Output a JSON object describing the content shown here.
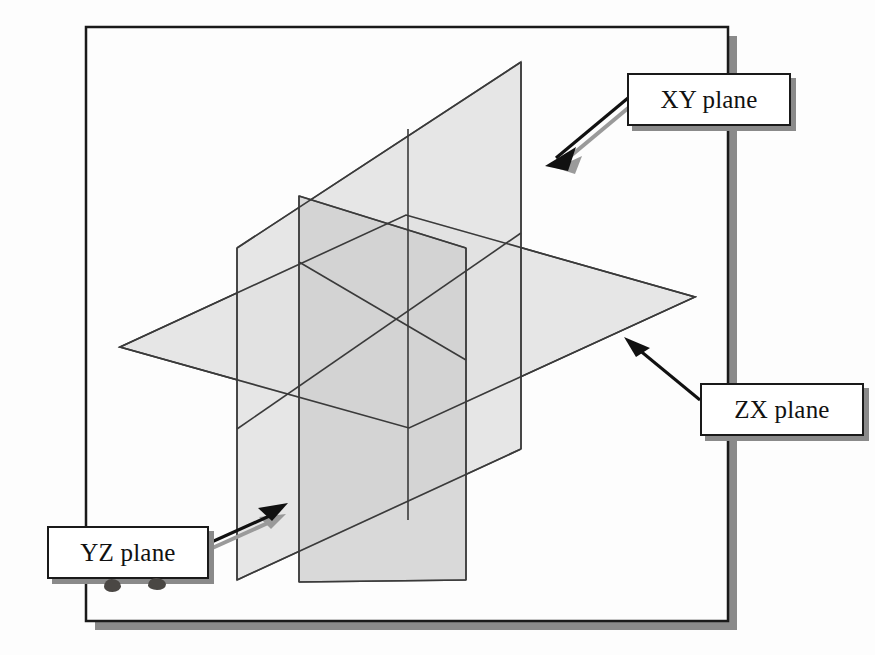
{
  "figure": {
    "type": "diagram",
    "background_color": "#fdfdfd",
    "frame": {
      "name": "figure-border",
      "border_color": "#1a1a1a",
      "shadow_color": "#8a8a8a",
      "x": 86,
      "y": 27,
      "width": 642,
      "height": 594
    }
  },
  "callouts": [
    {
      "id": "xy",
      "label": "XY plane",
      "border_color": "#1a1a1a",
      "shadow_color": "#8a8a8a",
      "fill_color": "#ffffff"
    },
    {
      "id": "zx",
      "label": "ZX plane",
      "border_color": "#1a1a1a",
      "shadow_color": "#8a8a8a",
      "fill_color": "#ffffff"
    },
    {
      "id": "yz",
      "label": "YZ plane",
      "border_color": "#1a1a1a",
      "shadow_color": "#8a8a8a",
      "fill_color": "#ffffff"
    }
  ],
  "planes": [
    {
      "id": "xy",
      "name": "XY plane",
      "orientation": "vertical, receding to the right",
      "fill_color": "#e4e4e4",
      "stroke_color": "#3a3a3a"
    },
    {
      "id": "yz",
      "name": "YZ plane",
      "orientation": "vertical, facing the viewer",
      "fill_color": "#dedede",
      "stroke_color": "#3a3a3a"
    },
    {
      "id": "zx",
      "name": "ZX plane",
      "orientation": "horizontal",
      "fill_color": "#e4e4e4",
      "stroke_color": "#3a3a3a"
    }
  ],
  "arrows": [
    {
      "id": "xy-arrow",
      "from_callout": "xy",
      "points_to": "XY plane upper-right edge",
      "color": "#111111",
      "shadow_color": "#9a9a9a"
    },
    {
      "id": "zx-arrow",
      "from_callout": "zx",
      "points_to": "ZX plane right vertex",
      "color": "#111111",
      "shadow_color": "#9a9a9a"
    },
    {
      "id": "yz-arrow",
      "from_callout": "yz",
      "points_to": "YZ plane lower-left edge",
      "color": "#111111",
      "shadow_color": "#9a9a9a"
    }
  ],
  "scan_artifacts": {
    "ghost_text_color": "#d8d6d2",
    "ghost_lines": [
      "ation with the coordinate",
      "with the same orientation",
      "the XY plane.",
      "To specify a point in the space",
      "the plane from a dialog region.",
      "necessary for the Coordinates command",
      "button changes that coordinate"
    ],
    "smudges": 2
  }
}
